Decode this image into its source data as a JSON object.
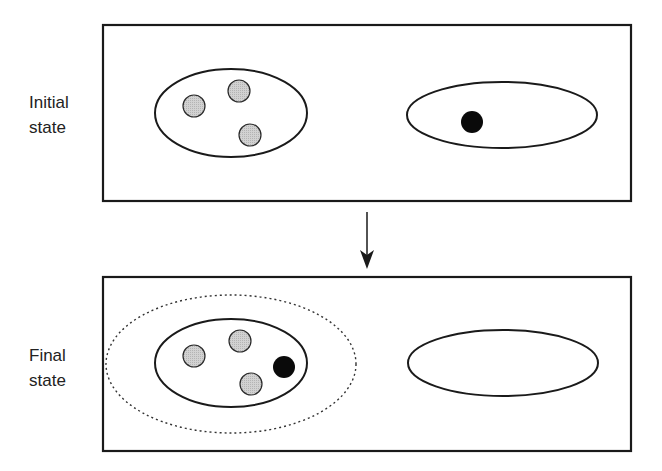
{
  "diagram": {
    "type": "state-transition",
    "colors": {
      "stroke": "#1a1a1a",
      "gray_particle": "#c8c8c8",
      "black_particle": "#0a0a0a",
      "background": "#ffffff"
    },
    "panels": [
      {
        "id": "initial",
        "label_line1": "Initial",
        "label_line2": "state",
        "left_group": {
          "gray_particles": 3,
          "black_particles": 0
        },
        "right_group": {
          "gray_particles": 0,
          "black_particles": 1
        },
        "enclosing_dotted_boundary": false
      },
      {
        "id": "final",
        "label_line1": "Final",
        "label_line2": "state",
        "left_group": {
          "gray_particles": 3,
          "black_particles": 1
        },
        "right_group": {
          "gray_particles": 0,
          "black_particles": 0
        },
        "enclosing_dotted_boundary": true
      }
    ],
    "transition_arrow": {
      "direction": "down",
      "from": "initial",
      "to": "final"
    }
  },
  "labels": {
    "initial": "Initial\nstate",
    "final": "Final\nstate"
  }
}
